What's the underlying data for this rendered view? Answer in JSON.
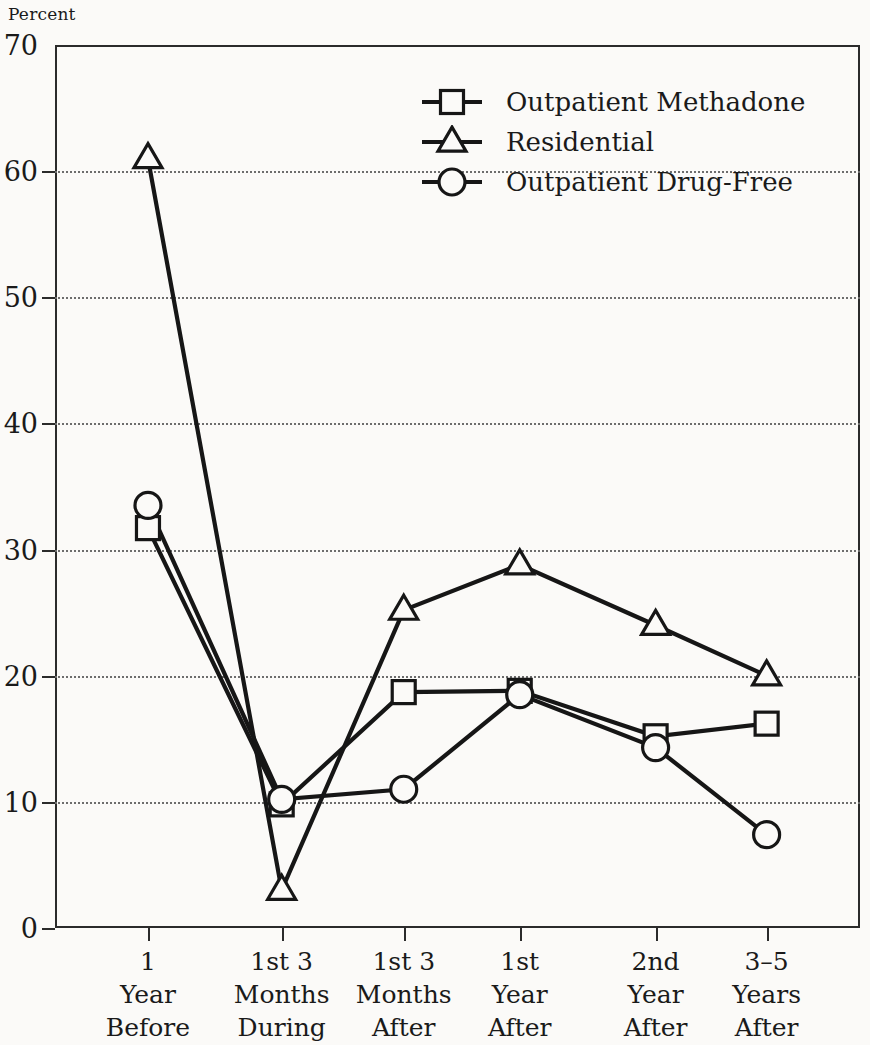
{
  "axis": {
    "unit_label": "Percent",
    "y_ticks": [
      0,
      10,
      20,
      30,
      40,
      50,
      60,
      70
    ],
    "x_categories": [
      {
        "line1": "1",
        "line2": "Year",
        "line3": "Before"
      },
      {
        "line1": "1st 3",
        "line2": "Months",
        "line3": "During"
      },
      {
        "line1": "1st 3",
        "line2": "Months",
        "line3": "After"
      },
      {
        "line1": "1st",
        "line2": "Year",
        "line3": "After"
      },
      {
        "line1": "2nd",
        "line2": "Year",
        "line3": "After"
      },
      {
        "line1": "3–5",
        "line2": "Years",
        "line3": "After"
      }
    ]
  },
  "legend": {
    "position": "upper-center",
    "entries": [
      {
        "label": "Outpatient Methadone",
        "marker": "square-icon"
      },
      {
        "label": "Residential",
        "marker": "triangle-icon"
      },
      {
        "label": "Outpatient Drug-Free",
        "marker": "circle-icon"
      }
    ]
  },
  "style": {
    "line_color": "#161616",
    "marker_fill": "#fbfaf8",
    "grid_color": "#6d6d6d",
    "axis_color": "#2b2b2b",
    "background": "#fbfaf8"
  },
  "chart_data": {
    "type": "line",
    "title": "",
    "subtitle": "",
    "xlabel": "",
    "ylabel": "Percent",
    "ylim": [
      0,
      70
    ],
    "ytick_step": 10,
    "grid": "horizontal-dotted",
    "legend_position": "upper-center",
    "categories": [
      "1 Year Before",
      "1st 3 Months During",
      "1st 3 Months After",
      "1st Year After",
      "2nd Year After",
      "3–5 Years After"
    ],
    "series": [
      {
        "name": "Outpatient Methadone",
        "marker": "square",
        "values": [
          31.7,
          9.8,
          18.7,
          18.8,
          15.2,
          16.2
        ]
      },
      {
        "name": "Residential",
        "marker": "triangle",
        "values": [
          61.0,
          3.0,
          25.2,
          28.8,
          24.0,
          20.0
        ]
      },
      {
        "name": "Outpatient Drug-Free",
        "marker": "circle",
        "values": [
          33.5,
          10.2,
          11.0,
          18.5,
          14.3,
          7.4
        ]
      }
    ]
  }
}
